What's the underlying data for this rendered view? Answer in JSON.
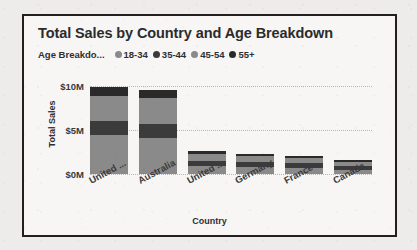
{
  "chart_data": {
    "type": "bar",
    "stacked": true,
    "title": "Total Sales by Country and Age Breakdown",
    "xlabel": "Country",
    "ylabel": "Total Sales",
    "categories": [
      "United ...",
      "Australia",
      "United ...",
      "Germany",
      "France",
      "Canada"
    ],
    "ytick_labels": [
      "$0M",
      "$5M",
      "$10M"
    ],
    "ytick_values": [
      0,
      5,
      10
    ],
    "ylim": [
      0,
      11.5
    ],
    "grid": true,
    "legend_title": "Age Breakdo...",
    "legend_position": "top",
    "series": [
      {
        "name": "18-34",
        "color": "#8a8a8a",
        "values": [
          4.4,
          4.1,
          0.9,
          0.8,
          0.7,
          0.5
        ]
      },
      {
        "name": "35-44",
        "color": "#3b3b3b",
        "values": [
          1.6,
          1.6,
          0.6,
          0.55,
          0.5,
          0.42
        ]
      },
      {
        "name": "45-54",
        "color": "#8a8a8a",
        "values": [
          2.9,
          2.9,
          0.75,
          0.65,
          0.6,
          0.45
        ]
      },
      {
        "name": "55+",
        "color": "#2a2a2a",
        "values": [
          1.0,
          1.0,
          0.35,
          0.32,
          0.3,
          0.23
        ]
      }
    ]
  },
  "colors": {
    "border": "#231f20",
    "card_background": "#f7f6f4",
    "page_background": "#edecea",
    "text": "#2b2b2e",
    "gridline": "#b9b7b3"
  }
}
